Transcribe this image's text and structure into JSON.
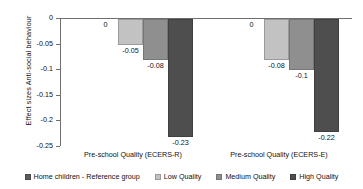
{
  "chart_data": {
    "type": "bar",
    "title": "",
    "xlabel": "",
    "ylabel": "Effect sizes Anti-social behaviour",
    "ylim": [
      -0.25,
      0
    ],
    "yticks": [
      "0",
      "-0.05",
      "-0.1",
      "-0.15",
      "-0.2",
      "-0.25"
    ],
    "ytick_values": [
      0,
      -0.05,
      -0.1,
      -0.15,
      -0.2,
      -0.25
    ],
    "grid": false,
    "legend_position": "bottom",
    "categories": [
      "Pre-school Quality (ECERS-R)",
      "Pre-school Quality (ECERS-E)"
    ],
    "series": [
      {
        "name": "Home children - Reference group",
        "key": "ref",
        "color": "#5c5c5c",
        "values": [
          0,
          0
        ],
        "labels": [
          "0",
          "0"
        ]
      },
      {
        "name": "Low Quality",
        "key": "low",
        "color": "#c2c2c2",
        "values": [
          -0.05,
          -0.08
        ],
        "labels": [
          "-0.05",
          "-0.08"
        ]
      },
      {
        "name": "Medium Quality",
        "key": "medium",
        "color": "#8f8f8f",
        "values": [
          -0.08,
          -0.1
        ],
        "labels": [
          "-0.08",
          "-0.1"
        ]
      },
      {
        "name": "High Quality",
        "key": "high",
        "color": "#4e4e4e",
        "values": [
          -0.23,
          -0.22
        ],
        "labels": [
          "-0.23",
          "-0.22"
        ]
      }
    ]
  }
}
